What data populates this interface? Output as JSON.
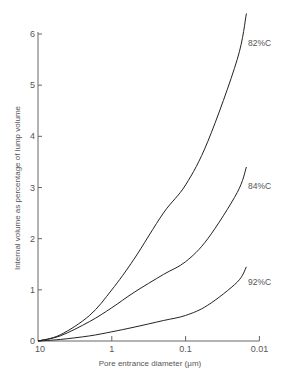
{
  "chart_data": {
    "type": "line",
    "title": "",
    "xlabel": "Pore entrance diameter (μm)",
    "ylabel": "Internal volume as percentage of lump volume",
    "x_scale": "log",
    "x_reversed": true,
    "xlim": [
      10,
      0.01
    ],
    "ylim": [
      0,
      6
    ],
    "x_ticks": [
      "10",
      "1",
      "0.1",
      "0.01"
    ],
    "y_ticks": [
      "0",
      "1",
      "2",
      "3",
      "4",
      "5",
      "6"
    ],
    "grid": false,
    "legend": "inline labels at curve ends",
    "x": [
      10,
      5,
      2,
      1,
      0.5,
      0.2,
      0.1,
      0.05,
      0.02,
      0.015
    ],
    "series": [
      {
        "name": "82%C",
        "values": [
          0,
          0.12,
          0.5,
          1.0,
          1.6,
          2.5,
          3.05,
          3.9,
          5.5,
          6.4
        ]
      },
      {
        "name": "84%C",
        "values": [
          0,
          0.1,
          0.38,
          0.65,
          0.95,
          1.3,
          1.55,
          2.0,
          2.9,
          3.4
        ]
      },
      {
        "name": "92%C",
        "values": [
          0,
          0.03,
          0.1,
          0.18,
          0.27,
          0.4,
          0.5,
          0.7,
          1.15,
          1.45
        ]
      }
    ]
  },
  "labels": {
    "xlabel": "Pore entrance diameter (μm)",
    "ylabel": "Internal volume as percentage of lump volume"
  }
}
